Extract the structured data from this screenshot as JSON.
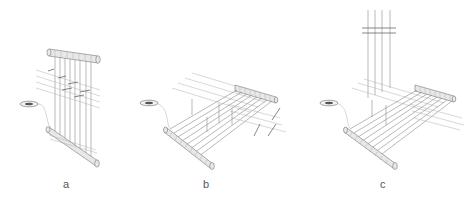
{
  "figure": {
    "panels": [
      {
        "id": "a",
        "label": "a",
        "description": "Vertical loom: upper and lower warp beams with vertical warp threads, horizontal weft threads crossing, shuttle at left"
      },
      {
        "id": "b",
        "label": "b",
        "description": "Horizontal loom: warp beams near and far, warp threads stretched horizontally, vertical heddle drops, shuttle at left"
      },
      {
        "id": "c",
        "label": "c",
        "description": "Horizontal loom with overhead vertical threads descending from a grid above, shuttle at left"
      }
    ],
    "colors": {
      "line": "#8a8a8a",
      "light_line": "#b0b0b0",
      "roll_fill": "#e8e8e8",
      "label": "#555555"
    }
  }
}
